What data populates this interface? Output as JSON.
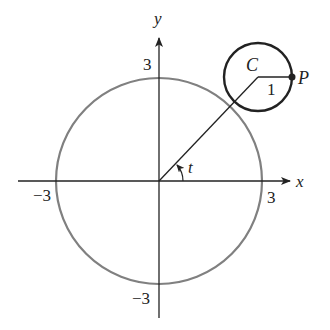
{
  "diagram": {
    "axes": {
      "x_label": "x",
      "y_label": "y",
      "x_pos_tick": "3",
      "x_neg_tick": "−3",
      "y_pos_tick": "3",
      "y_neg_tick": "−3"
    },
    "big_circle": {
      "radius_units": 3,
      "color": "#808080"
    },
    "small_circle": {
      "center_label": "C",
      "point_label": "P",
      "radius_label": "1",
      "radius_units": 1,
      "color": "#222222"
    },
    "angle_label": "t",
    "colors": {
      "ink": "#222222",
      "big_circle": "#808080"
    }
  }
}
